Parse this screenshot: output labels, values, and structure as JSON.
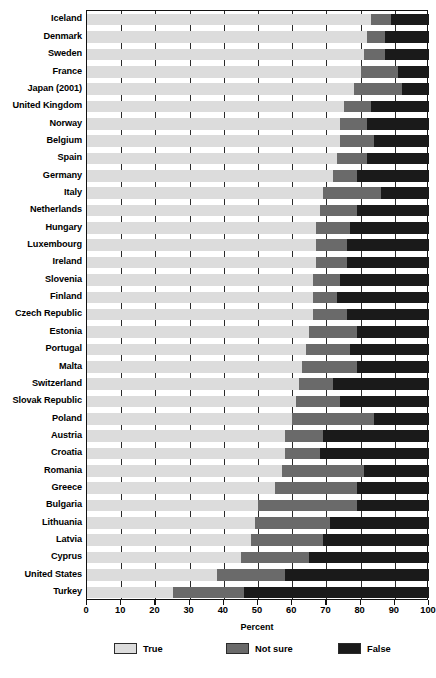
{
  "chart_data": {
    "type": "bar",
    "subtype": "stacked-horizontal",
    "title": "",
    "xlabel": "Percent",
    "ylabel": "",
    "xlim": [
      0,
      100
    ],
    "xticks": [
      0,
      10,
      20,
      30,
      40,
      50,
      60,
      70,
      80,
      90,
      100
    ],
    "grid": true,
    "legend_position": "bottom",
    "legend": [
      "True",
      "Not sure",
      "False"
    ],
    "colors": {
      "True": "#dcdcdc",
      "Not sure": "#6a6a6a",
      "False": "#1a1a1a",
      "axis": "#111111",
      "text": "#000000"
    },
    "categories": [
      "Iceland",
      "Denmark",
      "Sweden",
      "France",
      "Japan (2001)",
      "United Kingdom",
      "Norway",
      "Belgium",
      "Spain",
      "Germany",
      "Italy",
      "Netherlands",
      "Hungary",
      "Luxembourg",
      "Ireland",
      "Slovenia",
      "Finland",
      "Czech Republic",
      "Estonia",
      "Portugal",
      "Malta",
      "Switzerland",
      "Slovak Republic",
      "Poland",
      "Austria",
      "Croatia",
      "Romania",
      "Greece",
      "Bulgaria",
      "Lithuania",
      "Latvia",
      "Cyprus",
      "United States",
      "Turkey"
    ],
    "series": [
      {
        "name": "True",
        "values": [
          83,
          82,
          81,
          80,
          78,
          75,
          74,
          74,
          73,
          72,
          69,
          68,
          67,
          67,
          67,
          66,
          66,
          66,
          65,
          64,
          63,
          62,
          61,
          60,
          58,
          58,
          57,
          55,
          50,
          49,
          48,
          45,
          38,
          25
        ]
      },
      {
        "name": "Not sure",
        "values": [
          6,
          5,
          6,
          11,
          14,
          8,
          8,
          10,
          9,
          7,
          17,
          11,
          10,
          9,
          9,
          8,
          7,
          10,
          14,
          13,
          16,
          10,
          13,
          24,
          11,
          10,
          24,
          24,
          29,
          22,
          21,
          20,
          20,
          21
        ]
      },
      {
        "name": "False",
        "values": [
          11,
          13,
          13,
          9,
          8,
          17,
          18,
          16,
          18,
          21,
          14,
          21,
          23,
          24,
          24,
          26,
          27,
          24,
          21,
          23,
          21,
          28,
          26,
          16,
          31,
          32,
          19,
          21,
          21,
          29,
          31,
          35,
          42,
          54
        ]
      }
    ]
  }
}
